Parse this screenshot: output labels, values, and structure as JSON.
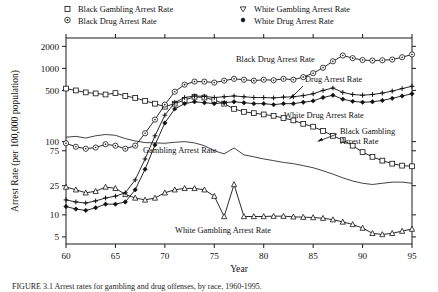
{
  "figure": {
    "caption_partial": "FIGURE 3.1  Arrest rates for gambling and drug offenses, by race, 1960-1995."
  },
  "chart_data": {
    "type": "line",
    "title": "",
    "xlabel": "Year",
    "ylabel": "Arrest Rate (per 100,000 population)",
    "y_scale": "log",
    "ylim": [
      4,
      2600
    ],
    "xlim": [
      60,
      95
    ],
    "grid": false,
    "legend_position": "top-outside",
    "y_ticks": [
      5,
      10,
      25,
      75,
      100,
      500,
      1000,
      2000
    ],
    "y_tick_labels": [
      "5",
      "10",
      "25",
      "75",
      "100",
      "500",
      "1000",
      "2000"
    ],
    "x_ticks": [
      60,
      65,
      70,
      75,
      80,
      85,
      90,
      95
    ],
    "x_tick_labels": [
      "60",
      "65",
      "70",
      "75",
      "80",
      "85",
      "90",
      "95"
    ],
    "x": [
      60,
      61,
      62,
      63,
      64,
      65,
      66,
      67,
      68,
      69,
      70,
      71,
      72,
      73,
      74,
      75,
      76,
      77,
      78,
      79,
      80,
      81,
      82,
      83,
      84,
      85,
      86,
      87,
      88,
      89,
      90,
      91,
      92,
      93,
      94,
      95
    ],
    "series": [
      {
        "name": "Black Gambling Arrest Rate",
        "marker": "open-square",
        "line": "solid",
        "values": [
          530,
          500,
          470,
          455,
          440,
          460,
          420,
          395,
          360,
          330,
          300,
          330,
          370,
          410,
          400,
          370,
          330,
          280,
          255,
          245,
          235,
          225,
          210,
          195,
          175,
          160,
          140,
          120,
          105,
          88,
          72,
          62,
          55,
          50,
          47,
          46
        ]
      },
      {
        "name": "Black Drug Arrest Rate",
        "marker": "open-circle",
        "line": "solid",
        "values": [
          95,
          85,
          80,
          83,
          92,
          88,
          80,
          88,
          130,
          200,
          320,
          480,
          600,
          660,
          660,
          640,
          680,
          720,
          700,
          680,
          700,
          690,
          720,
          700,
          760,
          860,
          1020,
          1250,
          1500,
          1380,
          1300,
          1280,
          1290,
          1320,
          1420,
          1550
        ]
      },
      {
        "name": "White Gambling Arrest Rate",
        "marker": "open-triangle",
        "line": "solid",
        "values": [
          24,
          22,
          20,
          21,
          24,
          23,
          19,
          17,
          16,
          17,
          20,
          22,
          23,
          23,
          22,
          18,
          9.5,
          26,
          9.5,
          9.5,
          9.5,
          9.6,
          9.6,
          9.4,
          9.3,
          9.2,
          9.0,
          8.6,
          8.0,
          7.4,
          6.6,
          5.6,
          5.4,
          5.6,
          6.0,
          6.4
        ]
      },
      {
        "name": "White Drug Arrest Rate",
        "marker": "solid-diamond",
        "line": "solid",
        "values": [
          13,
          12,
          11.5,
          12.5,
          14,
          14,
          15,
          22,
          42,
          90,
          180,
          280,
          330,
          350,
          340,
          330,
          340,
          350,
          340,
          330,
          330,
          320,
          330,
          330,
          345,
          360,
          400,
          430,
          380,
          355,
          345,
          350,
          365,
          390,
          420,
          450
        ]
      },
      {
        "name": "Drug Arrest Rate",
        "marker": "solid-plus",
        "line": "solid",
        "values": [
          16,
          15,
          14.5,
          15.5,
          17,
          18,
          20,
          30,
          58,
          120,
          230,
          340,
          400,
          420,
          415,
          400,
          410,
          420,
          410,
          400,
          400,
          395,
          405,
          410,
          425,
          450,
          500,
          540,
          470,
          440,
          430,
          440,
          460,
          490,
          530,
          570
        ]
      },
      {
        "name": "Gambling Arrest Rate",
        "marker": "none",
        "line": "solid",
        "values": [
          115,
          118,
          112,
          120,
          125,
          122,
          110,
          102,
          97,
          96,
          95,
          98,
          100,
          96,
          88,
          75,
          68,
          82,
          66,
          62,
          58,
          55,
          52,
          50,
          47,
          44,
          40,
          36,
          32,
          29,
          27,
          26,
          27,
          28,
          28,
          27
        ]
      }
    ],
    "annotations": [
      {
        "text": "Black Drug Arrest Rate",
        "x_px": 236,
        "y_px": 62,
        "arrow": false
      },
      {
        "text": "Drug Arrest Rate",
        "x_px": 305,
        "y_px": 82,
        "arrow": true
      },
      {
        "text": "White Drug Arrest Rate",
        "x_px": 284,
        "y_px": 118,
        "arrow": false
      },
      {
        "text": "Black Gambling",
        "x_px": 340,
        "y_px": 134,
        "arrow": true
      },
      {
        "text": "Arrest Rate",
        "x_px": 340,
        "y_px": 144,
        "arrow": false
      },
      {
        "text": "Gambling Arrest Rate",
        "x_px": 143,
        "y_px": 153,
        "arrow": false
      },
      {
        "text": "White Gambling Arrest Rate",
        "x_px": 175,
        "y_px": 233,
        "arrow": false
      }
    ]
  },
  "legend": {
    "items": [
      {
        "label": "Black Gambling Arrest Rate",
        "marker": "open-square"
      },
      {
        "label": "Black Drug Arrest Rate",
        "marker": "open-circle"
      },
      {
        "label": "White Gambling Arrest Rate",
        "marker": "open-triangle"
      },
      {
        "label": "White Drug Arrest Rate",
        "marker": "solid-dot"
      }
    ]
  }
}
